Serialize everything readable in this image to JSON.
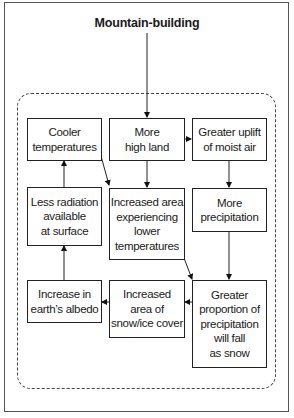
{
  "diagram": {
    "title": "Mountain-building",
    "nodes": [
      {
        "id": "cooler",
        "label": "Cooler\ntemperatures"
      },
      {
        "id": "more-high-land",
        "label": "More\nhigh land"
      },
      {
        "id": "greater-uplift",
        "label": "Greater uplift\nof moist air"
      },
      {
        "id": "less-radiation",
        "label": "Less radiation\navailable\nat surface"
      },
      {
        "id": "increased-area-lower-temp",
        "label": "Increased area\nexperiencing\nlower\ntemperatures"
      },
      {
        "id": "more-precipitation",
        "label": "More\nprecipitation"
      },
      {
        "id": "increase-albedo",
        "label": "Increase in\nearth’s albedo"
      },
      {
        "id": "increased-snow-ice",
        "label": "Increased\narea of\nsnow/ice cover"
      },
      {
        "id": "greater-proportion-snow",
        "label": "Greater\nproportion of\nprecipitation\nwill fall\nas snow"
      }
    ],
    "edges": [
      {
        "from": "title",
        "to": "more-high-land"
      },
      {
        "from": "more-high-land",
        "to": "greater-uplift"
      },
      {
        "from": "more-high-land",
        "to": "increased-area-lower-temp"
      },
      {
        "from": "greater-uplift",
        "to": "more-precipitation"
      },
      {
        "from": "more-precipitation",
        "to": "greater-proportion-snow"
      },
      {
        "from": "cooler",
        "to": "increased-area-lower-temp"
      },
      {
        "from": "increased-area-lower-temp",
        "to": "greater-proportion-snow"
      },
      {
        "from": "greater-proportion-snow",
        "to": "increased-snow-ice"
      },
      {
        "from": "increased-snow-ice",
        "to": "increase-albedo"
      },
      {
        "from": "increase-albedo",
        "to": "less-radiation"
      },
      {
        "from": "less-radiation",
        "to": "cooler"
      }
    ]
  }
}
